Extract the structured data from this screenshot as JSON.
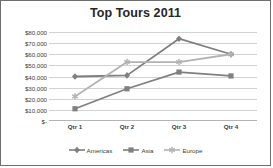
{
  "chart_data": {
    "type": "line",
    "title": "Top Tours 2011",
    "xlabel": "",
    "ylabel": "",
    "categories": [
      "Qtr 1",
      "Qtr 2",
      "Qtr 3",
      "Qtr 4"
    ],
    "series": [
      {
        "name": "Americas",
        "marker": "diamond",
        "color": "#7f7f7f",
        "values": [
          40000,
          41000,
          74000,
          60000
        ]
      },
      {
        "name": "Asia",
        "marker": "square",
        "color": "#808080",
        "values": [
          11000,
          29000,
          44000,
          40500
        ]
      },
      {
        "name": "Europe",
        "marker": "star",
        "color": "#b3b3b3",
        "values": [
          22000,
          53000,
          53000,
          60000
        ]
      }
    ],
    "ylim": [
      0,
      80000
    ],
    "ytick_labels": [
      "$80,000",
      "$70,000",
      "$60,000",
      "$50,000",
      "$40,000",
      "$30,000",
      "$20,000",
      "$10,000",
      "$-"
    ],
    "ytick_values": [
      80000,
      70000,
      60000,
      50000,
      40000,
      30000,
      20000,
      10000,
      0
    ],
    "grid": true,
    "legend_position": "bottom",
    "gridline_color": "#d2d2d2",
    "border_color": "#6f6f6f",
    "title_color": "#262626",
    "background": "#ffffff"
  }
}
